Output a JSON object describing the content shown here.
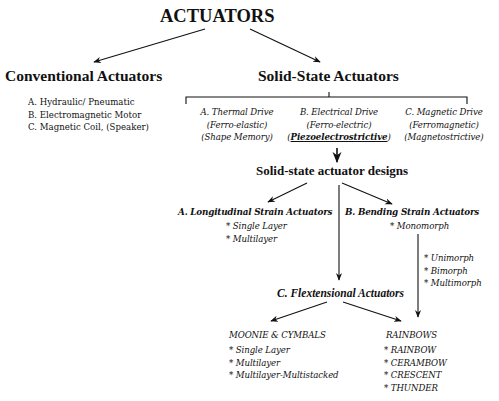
{
  "title": "ACTUATORS",
  "conventional": {
    "heading": "Conventional Actuators",
    "items": [
      "A. Hydraulic/ Pneumatic",
      "B. Electromagnetic Motor",
      "C. Magnetic Coil, (Speaker)"
    ]
  },
  "solid_state": {
    "heading": "Solid-State Actuators",
    "drives": [
      {
        "name": "A. Thermal Drive",
        "sub1": "(Ferro-elastic)",
        "sub2": "(Shape Memory)"
      },
      {
        "name": "B. Electrical Drive",
        "sub1": "(Ferro-electric)",
        "sub2_open": "(",
        "sub2_emph": "Piezoelectrostrictive",
        "sub2_close": ")"
      },
      {
        "name": "C. Magnetic Drive",
        "sub1": "(Ferromagnetic)",
        "sub2": "(Magnetostrictive)"
      }
    ]
  },
  "designs": {
    "heading": "Solid-state actuator designs",
    "longitudinal": {
      "heading": "A. Longitudinal Strain Actuators",
      "items": [
        "* Single Layer",
        "* Multilayer"
      ]
    },
    "bending": {
      "heading": "B. Bending Strain Actuators",
      "items": [
        "* Monomorph"
      ],
      "sub_items": [
        "* Unimorph",
        "* Bimorph",
        "* Multimorph"
      ]
    },
    "flextensional": {
      "heading": "C. Flextensional Actuators",
      "moonie": {
        "heading": "MOONIE & CYMBALS",
        "items": [
          "* Single Layer",
          "* Multilayer",
          "* Multilayer-Multistacked"
        ]
      },
      "rainbows": {
        "heading": "RAINBOWS",
        "items": [
          "* RAINBOW",
          "* CERAMBOW",
          "* CRESCENT",
          "* THUNDER"
        ]
      }
    }
  },
  "colors": {
    "ink": "#111111",
    "background": "#ffffff"
  }
}
